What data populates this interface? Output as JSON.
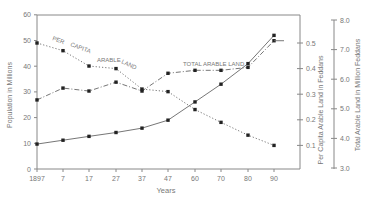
{
  "chart_data": {
    "type": "line",
    "title": "",
    "xlabel": "Years",
    "ylabel": "Population in Millions",
    "ylabel_right_1": "Per Capita Arable Land in Feddans",
    "ylabel_right_2": "Total Arable Land in Million Feddans",
    "categories": [
      "1897",
      "7",
      "17",
      "27",
      "37",
      "47",
      "60",
      "70",
      "80",
      "90"
    ],
    "x_years": [
      1897,
      1907,
      1917,
      1927,
      1937,
      1947,
      1960,
      1970,
      1980,
      1990
    ],
    "ylim": [
      0,
      60
    ],
    "ylim_right_1": [
      0,
      0.5
    ],
    "ylim_right_2": [
      3.0,
      8.0
    ],
    "yticks": [
      "0",
      "10",
      "20",
      "30",
      "40",
      "50",
      "60"
    ],
    "yticks_right_1": [
      "0.1",
      "0.2",
      "0.3",
      "0.4",
      "0.5"
    ],
    "yticks_right_2": [
      "3.0",
      "4.0",
      "5.0",
      "6.0",
      "7.0",
      "8.0"
    ],
    "grid": false,
    "series": [
      {
        "name": "Population",
        "axis": "left",
        "style": "solid",
        "values": [
          9.7,
          11.2,
          12.7,
          14.2,
          15.9,
          19.0,
          26.1,
          33.0,
          41.0,
          52.0
        ]
      },
      {
        "name": "Per Capita Arable Land",
        "axis": "right_1",
        "style": "dotted",
        "label_words": [
          "PER",
          "CAPITA",
          "ARABLE",
          "LAND"
        ],
        "values": [
          0.5,
          0.47,
          0.41,
          0.4,
          0.32,
          0.31,
          0.24,
          0.19,
          0.14,
          0.1
        ]
      },
      {
        "name": "Total Arable Land",
        "axis": "right_2",
        "style": "dash-dot",
        "label": "TOTAL ARABLE LAND",
        "values": [
          5.3,
          5.7,
          5.6,
          5.9,
          5.6,
          6.2,
          6.3,
          6.3,
          6.4,
          7.3
        ]
      }
    ]
  }
}
